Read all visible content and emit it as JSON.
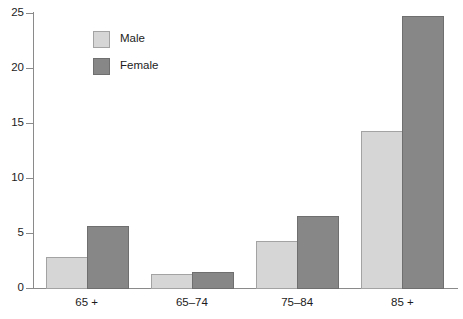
{
  "chart_data": {
    "type": "bar",
    "title": "",
    "subtitle": "",
    "xlabel": "",
    "ylabel": "",
    "categories": [
      "65 +",
      "65–74",
      "75–84",
      "85 +"
    ],
    "series": [
      {
        "name": "Male",
        "color": "#d6d6d6",
        "values": [
          2.85,
          1.25,
          4.3,
          14.3
        ]
      },
      {
        "name": "Female",
        "color": "#878787",
        "values": [
          5.6,
          1.45,
          6.55,
          24.7
        ]
      }
    ],
    "ylim": [
      0,
      25
    ],
    "yticks": [
      0,
      5,
      10,
      15,
      20,
      25
    ],
    "ytick_labels": [
      "0",
      "5",
      "10",
      "15",
      "20",
      "25"
    ],
    "grid": false,
    "legend_position": "upper-left",
    "legend_entries": [
      "Male",
      "Female"
    ],
    "axis_color": "#8a8a8a",
    "bar_border_color": "#9a9a9a",
    "background": "#ffffff"
  }
}
